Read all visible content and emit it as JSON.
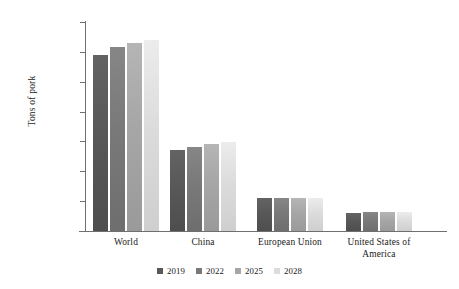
{
  "chart_data": {
    "type": "bar",
    "title": "",
    "subtitle": "",
    "xlabel": "",
    "ylabel": "Tons of pork",
    "categories": [
      "World",
      "China",
      "European Union",
      "United States of America"
    ],
    "series": [
      {
        "name": "2019",
        "color": "#585858",
        "values": [
          118000000,
          54000000,
          22000000,
          12000000
        ]
      },
      {
        "name": "2022",
        "color": "#797979",
        "values": [
          123000000,
          56000000,
          22000000,
          13000000
        ]
      },
      {
        "name": "2025",
        "color": "#a6a6a6",
        "values": [
          126000000,
          58000000,
          22000000,
          13000000
        ]
      },
      {
        "name": "2028",
        "color": "#dcdcdc",
        "values": [
          128000000,
          59500000,
          22000000,
          13000000
        ]
      }
    ],
    "ylim": [
      0,
      140000000
    ],
    "ytick_values": [
      140000000,
      120000000,
      100000000,
      80000000,
      60000000,
      40000000,
      20000000,
      0
    ],
    "ytick_labels": [
      "140,000,000",
      "120,000,000",
      "100,000,000",
      "80,000,000",
      "60,000,000",
      "40,000,000",
      "20,000,000",
      ""
    ],
    "grid": false,
    "legend_position": "bottom"
  },
  "axis": {
    "y_title": "Tons of pork"
  },
  "categories": [
    {
      "label_line1": "World",
      "label_line2": ""
    },
    {
      "label_line1": "China",
      "label_line2": ""
    },
    {
      "label_line1": "European Union",
      "label_line2": ""
    },
    {
      "label_line1": "United States of",
      "label_line2": "America"
    }
  ],
  "legend": {
    "items": [
      {
        "label": "2019"
      },
      {
        "label": "2022"
      },
      {
        "label": "2025"
      },
      {
        "label": "2028"
      }
    ]
  },
  "artifacts": {
    "top_cropped_text": "",
    "top_right_cropped_text": ""
  }
}
